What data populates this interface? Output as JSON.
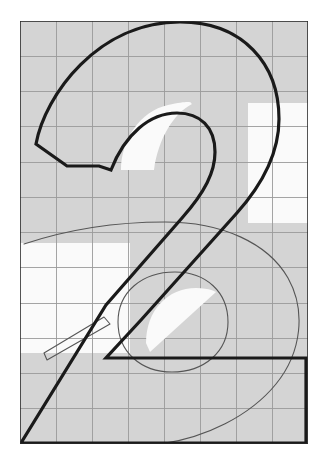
{
  "document": {
    "title": "Glyph Overlay Comparison",
    "type": "typographic-glyph-diagram",
    "canvas": {
      "width": 328,
      "height": 469
    }
  },
  "colors": {
    "page_background": "#ffffff",
    "field_fill": "#d4d4d4",
    "counter_fill": "#fafafa",
    "grid_line": "#9a9a9a",
    "grid_line_minor": "#bdbdbd",
    "bold_outline": "#1a1a1a",
    "thin_outline": "#555555",
    "frame_border": "#2a2a2a"
  },
  "frame": {
    "name": "em-square-frame",
    "x": 20,
    "y": 21,
    "width": 288,
    "height": 423,
    "stroke_width": 1.6
  },
  "grid": {
    "visible": true,
    "origin_x": 20,
    "origin_y": 21,
    "columns": 8,
    "rows": 12,
    "cell_width": 36,
    "cell_height": 35.25,
    "stroke_width": 0.9
  },
  "glyphs": [
    {
      "name": "filled-numeral-two",
      "character": "2",
      "style": "solid-gray-fill",
      "fill": "#d4d4d4",
      "stroke": "#555555",
      "stroke_width": 1.1,
      "path": "M 24 320 C 24 243 96 200 172 200 C 250 200 308 244 308 320 C 308 398 246 444 168 444 C 92 444 24 398 24 320 Z",
      "counter_path": "M 112 320 C 112 281 137 258 170 258 C 205 258 228 282 228 320 C 228 360 204 384 168 384 C 134 384 112 360 112 320 Z"
    },
    {
      "name": "bold-outlined-numeral-two",
      "character": "2",
      "style": "bold-outline",
      "fill": "none",
      "stroke": "#1a1a1a",
      "stroke_width": 3.2,
      "description": "Bold contour of the numeral two with flat terminal, bowl, diagonal spine and base bar"
    }
  ],
  "regions": [
    {
      "name": "upper-right-white-notch",
      "fill": "#fafafa",
      "x": 248,
      "y": 103,
      "width": 60,
      "height": 120
    },
    {
      "name": "left-white-notch",
      "fill": "#fafafa",
      "x": 20,
      "y": 243,
      "width": 110,
      "height": 110
    },
    {
      "name": "upper-counter-white",
      "fill": "#fafafa"
    },
    {
      "name": "lower-counter-white",
      "fill": "#fafafa"
    }
  ],
  "annotations": {
    "caption": "",
    "labels": []
  }
}
